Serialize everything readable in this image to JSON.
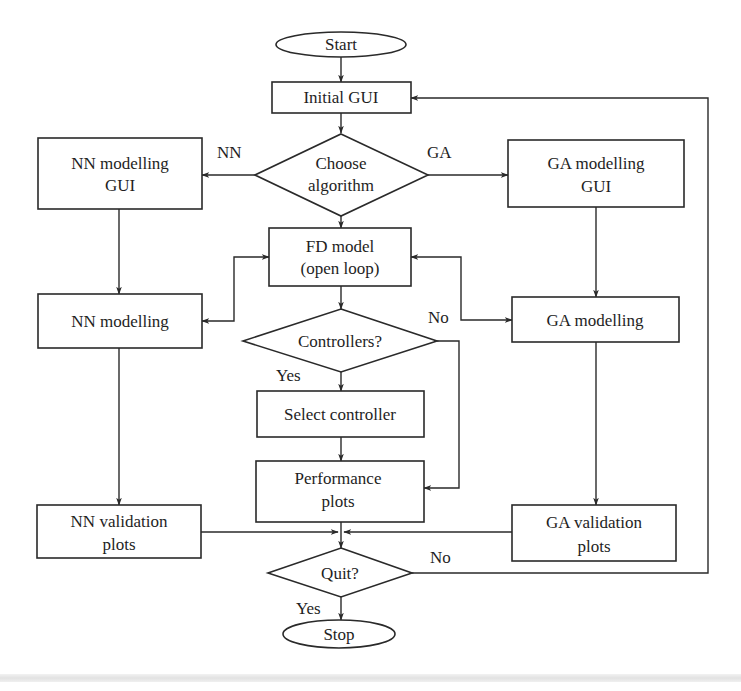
{
  "diagram": {
    "type": "flowchart",
    "colors": {
      "background": "#ffffff",
      "stroke": "#2a2a2a",
      "text": "#1e1e1e",
      "footer_band": "#e6e6e6"
    },
    "nodes": {
      "start": {
        "shape": "ellipse",
        "label": "Start"
      },
      "initial_gui": {
        "shape": "rect",
        "label": "Initial GUI"
      },
      "choose_algorithm": {
        "shape": "diamond",
        "line1": "Choose",
        "line2": "algorithm"
      },
      "nn_modelling_gui": {
        "shape": "rect",
        "line1": "NN modelling",
        "line2": "GUI"
      },
      "ga_modelling_gui": {
        "shape": "rect",
        "line1": "GA modelling",
        "line2": "GUI"
      },
      "fd_model": {
        "shape": "rect",
        "line1": "FD model",
        "line2": "(open loop)"
      },
      "nn_modelling": {
        "shape": "rect",
        "label": "NN modelling"
      },
      "ga_modelling": {
        "shape": "rect",
        "label": "GA modelling"
      },
      "controllers": {
        "shape": "diamond",
        "label": "Controllers?"
      },
      "select_controller": {
        "shape": "rect",
        "label": "Select controller"
      },
      "performance_plots": {
        "shape": "rect",
        "line1": "Performance",
        "line2": "plots"
      },
      "nn_validation_plots": {
        "shape": "rect",
        "line1": "NN validation",
        "line2": "plots"
      },
      "ga_validation_plots": {
        "shape": "rect",
        "line1": "GA validation",
        "line2": "plots"
      },
      "quit": {
        "shape": "diamond",
        "label": "Quit?"
      },
      "stop": {
        "shape": "ellipse",
        "label": "Stop"
      }
    },
    "edge_labels": {
      "nn": "NN",
      "ga": "GA",
      "controllers_no": "No",
      "controllers_yes": "Yes",
      "quit_no": "No",
      "quit_yes": "Yes"
    },
    "edges": [
      {
        "from": "start",
        "to": "initial_gui"
      },
      {
        "from": "initial_gui",
        "to": "choose_algorithm"
      },
      {
        "from": "choose_algorithm",
        "to": "nn_modelling_gui",
        "label": "NN"
      },
      {
        "from": "choose_algorithm",
        "to": "ga_modelling_gui",
        "label": "GA"
      },
      {
        "from": "choose_algorithm",
        "to": "fd_model"
      },
      {
        "from": "nn_modelling_gui",
        "to": "nn_modelling"
      },
      {
        "from": "ga_modelling_gui",
        "to": "ga_modelling"
      },
      {
        "from": "fd_model",
        "to": "nn_modelling",
        "bidirectional": true
      },
      {
        "from": "fd_model",
        "to": "ga_modelling",
        "bidirectional": true
      },
      {
        "from": "fd_model",
        "to": "controllers"
      },
      {
        "from": "controllers",
        "to": "select_controller",
        "label": "Yes"
      },
      {
        "from": "controllers",
        "to": "performance_plots",
        "label": "No"
      },
      {
        "from": "select_controller",
        "to": "performance_plots"
      },
      {
        "from": "nn_modelling",
        "to": "nn_validation_plots"
      },
      {
        "from": "ga_modelling",
        "to": "ga_validation_plots"
      },
      {
        "from": "performance_plots",
        "to": "quit"
      },
      {
        "from": "nn_validation_plots",
        "to": "quit"
      },
      {
        "from": "ga_validation_plots",
        "to": "quit"
      },
      {
        "from": "quit",
        "to": "stop",
        "label": "Yes"
      },
      {
        "from": "quit",
        "to": "initial_gui",
        "label": "No"
      }
    ]
  }
}
